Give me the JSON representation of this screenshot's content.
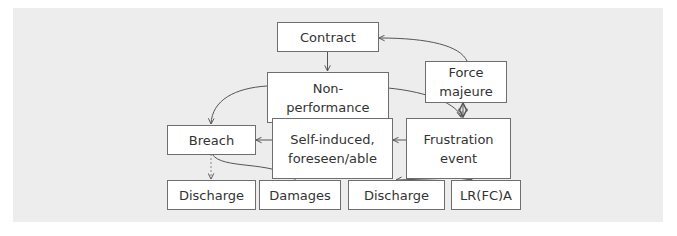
{
  "diagram": {
    "type": "flowchart",
    "colors": {
      "panel_background": "#ededed",
      "page_background": "#ffffff",
      "node_fill": "#ffffff",
      "node_border": "#6e6e6e",
      "edge": "#555555",
      "text": "#333333"
    },
    "nodes": {
      "contract": {
        "label": "Contract"
      },
      "force_majeure": {
        "label": "Force\nmajeure"
      },
      "non_performance": {
        "label": "Non-\nperformance"
      },
      "breach": {
        "label": "Breach"
      },
      "self_induced": {
        "label": "Self-induced,\nforeseen/able"
      },
      "frustration_event": {
        "label": "Frustration\nevent"
      },
      "discharge_breach": {
        "label": "Discharge"
      },
      "damages": {
        "label": "Damages"
      },
      "discharge_frustration": {
        "label": "Discharge"
      },
      "lrfca": {
        "label": "LR(FC)A"
      }
    },
    "edges": [
      {
        "from": "contract",
        "to": "non_performance",
        "style": "solid"
      },
      {
        "from": "force_majeure",
        "to": "contract",
        "style": "solid"
      },
      {
        "from": "non_performance",
        "to": "breach",
        "style": "solid"
      },
      {
        "from": "non_performance",
        "to": "frustration_event",
        "style": "solid"
      },
      {
        "from": "force_majeure",
        "to": "frustration_event",
        "style": "solid",
        "bidirectional": true
      },
      {
        "from": "frustration_event",
        "to": "self_induced",
        "style": "solid"
      },
      {
        "from": "self_induced",
        "to": "breach",
        "style": "solid"
      },
      {
        "from": "breach",
        "to": "discharge_breach",
        "style": "dashed"
      },
      {
        "from": "breach",
        "to": "damages",
        "style": "solid"
      },
      {
        "from": "frustration_event",
        "to": "discharge_frustration",
        "style": "solid"
      },
      {
        "from": "frustration_event",
        "to": "lrfca",
        "style": "solid"
      }
    ]
  }
}
